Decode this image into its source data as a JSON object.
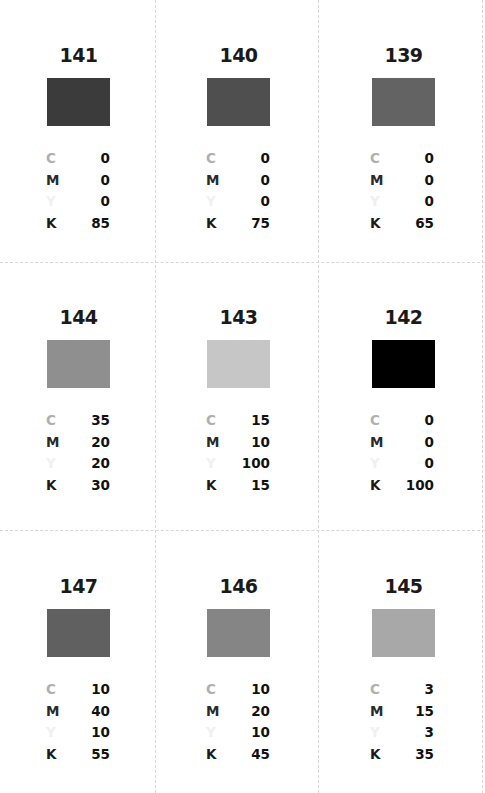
{
  "swatches": [
    {
      "number": "141",
      "color": "#3b3b3b",
      "C": "0",
      "M": "0",
      "Y": "0",
      "K": "85"
    },
    {
      "number": "140",
      "color": "#4f4f4f",
      "C": "0",
      "M": "0",
      "Y": "0",
      "K": "75"
    },
    {
      "number": "139",
      "color": "#636363",
      "C": "0",
      "M": "0",
      "Y": "0",
      "K": "65"
    },
    {
      "number": "144",
      "color": "#8f8f8f",
      "C": "35",
      "M": "20",
      "Y": "20",
      "K": "30"
    },
    {
      "number": "143",
      "color": "#c6c6c6",
      "C": "15",
      "M": "10",
      "Y": "100",
      "K": "15"
    },
    {
      "number": "142",
      "color": "#000000",
      "C": "0",
      "M": "0",
      "Y": "0",
      "K": "100"
    },
    {
      "number": "147",
      "color": "#606060",
      "C": "10",
      "M": "40",
      "Y": "10",
      "K": "55"
    },
    {
      "number": "146",
      "color": "#858585",
      "C": "10",
      "M": "20",
      "Y": "10",
      "K": "45"
    },
    {
      "number": "145",
      "color": "#a8a8a8",
      "C": "3",
      "M": "15",
      "Y": "3",
      "K": "35"
    }
  ],
  "labels": {
    "c": "C",
    "m": "M",
    "y": "Y",
    "k": "K"
  }
}
